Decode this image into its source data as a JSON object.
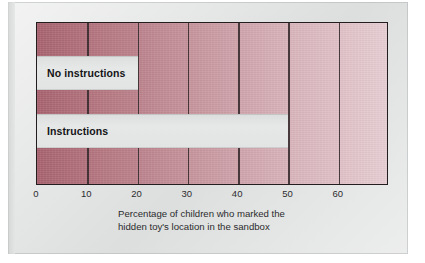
{
  "chart_data": {
    "type": "bar",
    "orientation": "horizontal",
    "title": "",
    "subtitle": "",
    "xlabel": "Percentage of children who marked the hidden toy's location in the sandbox",
    "ylabel": "",
    "categories": [
      "No instructions",
      "Instructions"
    ],
    "values": [
      20,
      50
    ],
    "series": [
      {
        "name": "Percentage of children",
        "values": [
          20,
          50
        ]
      }
    ],
    "xlim": [
      0,
      70
    ],
    "xticks": [
      0,
      10,
      20,
      30,
      40,
      50,
      60
    ],
    "xtick_labels": [
      "0",
      "10",
      "20",
      "30",
      "40",
      "50",
      "60"
    ],
    "grid": true,
    "grid_axis": "x",
    "legend": false,
    "legend_position": "none",
    "bar_style": "negative-space: light gray bars cut out of a pink gradient field",
    "colors": {
      "field_gradient_start": "#a8636f",
      "field_gradient_end": "#e6ced3",
      "bar_fill": "#e2e4e3",
      "axis_line": "#241d1f",
      "gridline": "#3b2f32",
      "label_text": "#141416",
      "page_background": "#e2e4e3"
    },
    "annotations": [
      {
        "text": "No instructions",
        "value": 20,
        "position": "inside-bar-left"
      },
      {
        "text": "Instructions",
        "value": 50,
        "position": "inside-bar-left"
      }
    ]
  },
  "caption": {
    "line1": "Percentage of children who marked the",
    "line2": "hidden toy's location in the sandbox"
  }
}
